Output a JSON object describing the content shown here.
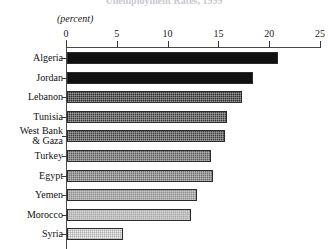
{
  "title_clipped": "Unemployment Rates, 1999",
  "units_label": "(percent)",
  "axis": {
    "ticks": [
      "0",
      "5",
      "10",
      "15",
      "20",
      "25"
    ],
    "min": 0,
    "max": 25
  },
  "chart_data": {
    "type": "bar",
    "orientation": "horizontal",
    "title": "Unemployment Rates, 1999",
    "xlabel": "(percent)",
    "ylabel": "",
    "xlim": [
      0,
      25
    ],
    "grid": false,
    "legend": "none",
    "categories": [
      "Algeria",
      "Jordan",
      "Lebanon",
      "Tunisia",
      "West Bank\n& Gaza",
      "Turkey",
      "Egypt",
      "Yemen",
      "Morocco",
      "Syria"
    ],
    "values": [
      20.8,
      18.3,
      17.2,
      15.7,
      15.6,
      14.2,
      14.4,
      12.8,
      12.2,
      5.5
    ],
    "bar_fills": [
      "#101010",
      "#111111",
      "#2a2a2a",
      "#3a3a3a",
      "#3e3e3e",
      "#5a5a5a",
      "#6e6e6e",
      "#8c8c8c",
      "#a8a8a8",
      "#ececec"
    ]
  }
}
